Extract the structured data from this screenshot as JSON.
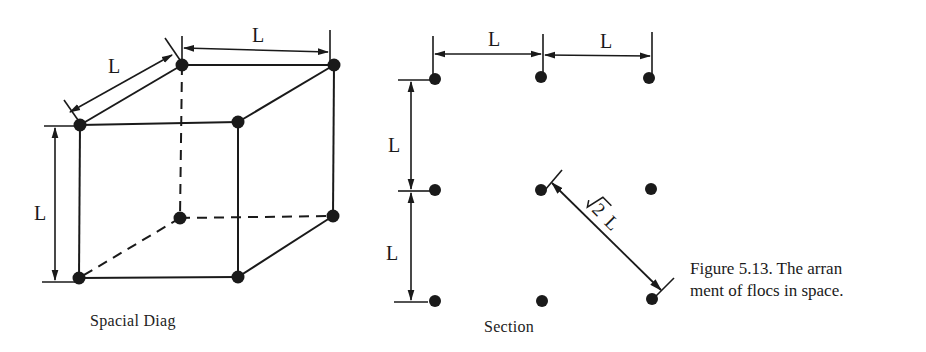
{
  "figure": {
    "caption_line1": "Figure 5.13. The arran",
    "caption_line2": "ment of flocs in space."
  },
  "left_diagram": {
    "title": "Spacial Diag",
    "dimension_labels": [
      "L",
      "L",
      "L"
    ]
  },
  "right_diagram": {
    "title": "Section",
    "dimension_labels": [
      "L",
      "L",
      "L",
      "L"
    ],
    "diagonal_label_root": "2",
    "diagonal_label_var": "L"
  },
  "colors": {
    "ink": "#1a1a1a",
    "background": "#ffffff"
  }
}
